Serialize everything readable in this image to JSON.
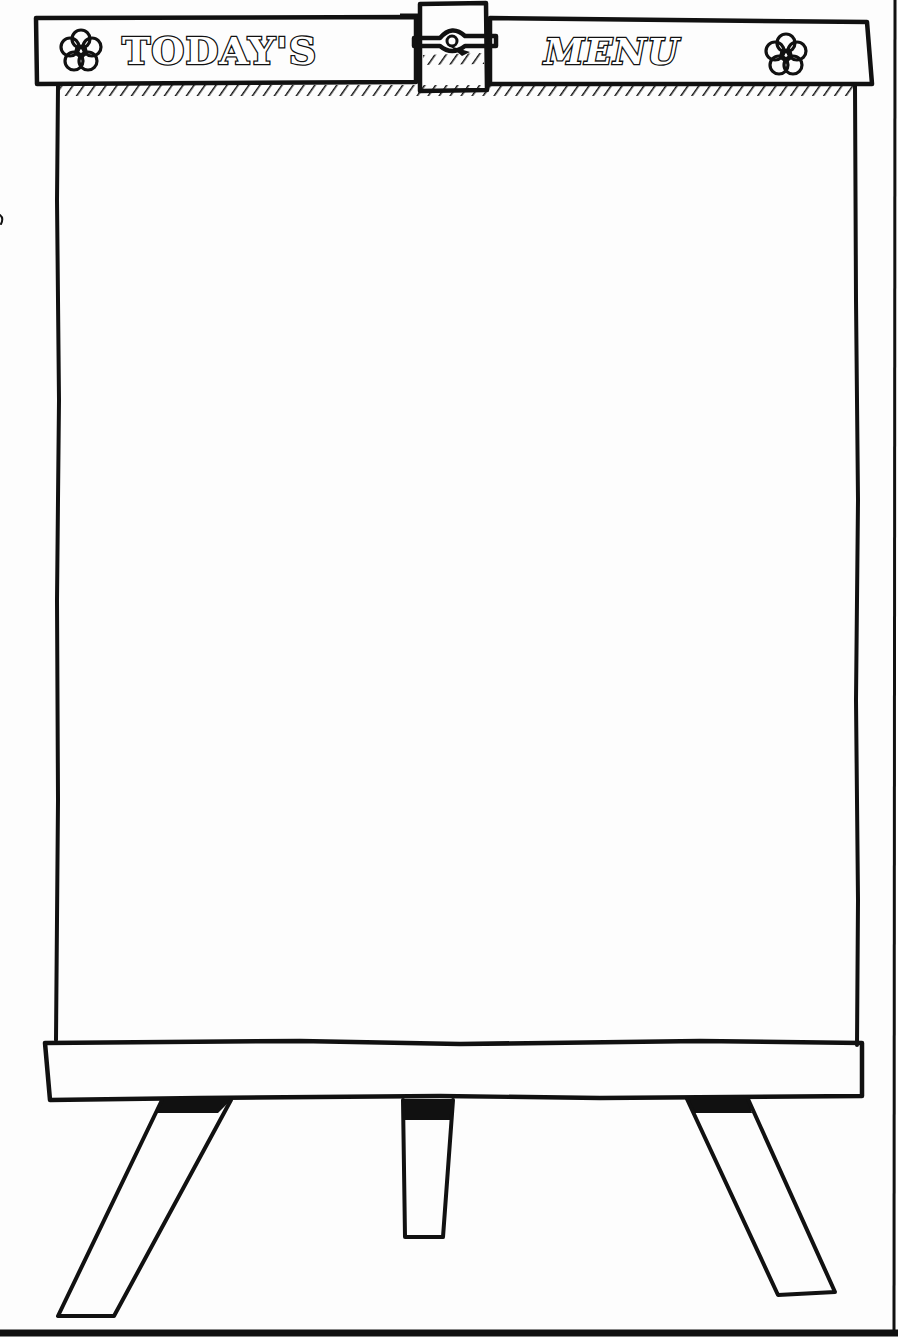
{
  "sign": {
    "title_left": "TODAY'S",
    "title_right": "MENU",
    "left_ornament": "flower-icon",
    "right_ornament": "flower-icon",
    "clip": "binder-clip-icon"
  },
  "board": {
    "content": ""
  },
  "colors": {
    "ink": "#111111",
    "paper": "#fdfdfd"
  }
}
